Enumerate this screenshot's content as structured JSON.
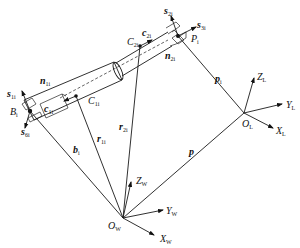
{
  "diagram": {
    "title": "",
    "frames": {
      "world": {
        "origin": "O",
        "origin_sub": "W",
        "axes": [
          {
            "name": "Z",
            "sub": "W"
          },
          {
            "name": "Y",
            "sub": "W"
          },
          {
            "name": "X",
            "sub": "W"
          }
        ]
      },
      "local": {
        "origin": "O",
        "origin_sub": "L",
        "axes": [
          {
            "name": "Z",
            "sub": "L"
          },
          {
            "name": "Y",
            "sub": "L"
          },
          {
            "name": "X",
            "sub": "L"
          }
        ]
      }
    },
    "points": [
      {
        "name": "B",
        "sub": "i"
      },
      {
        "name": "C",
        "sub": "1i"
      },
      {
        "name": "C",
        "sub": "2i"
      },
      {
        "name": "P",
        "sub": "i"
      }
    ],
    "vectors": [
      {
        "name": "b",
        "sub": "i"
      },
      {
        "name": "r",
        "sub": "1i"
      },
      {
        "name": "r",
        "sub": "2i"
      },
      {
        "name": "p",
        "sub": ""
      },
      {
        "name": "p",
        "sub": "i"
      },
      {
        "name": "c",
        "sub": "1i"
      },
      {
        "name": "c",
        "sub": "2i"
      },
      {
        "name": "n",
        "sub": "1i"
      },
      {
        "name": "n",
        "sub": "2i"
      },
      {
        "name": "s",
        "sub": "1i"
      },
      {
        "name": "s",
        "sub": "2i"
      },
      {
        "name": "s",
        "sub": "3i"
      },
      {
        "name": "s",
        "sub": "6i"
      }
    ]
  }
}
